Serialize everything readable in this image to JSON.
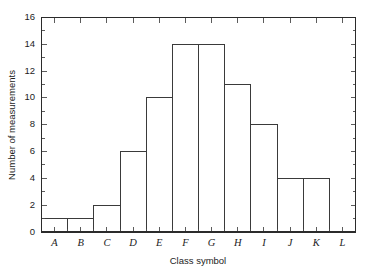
{
  "chart_data": {
    "type": "bar",
    "title": "",
    "subtitle": "",
    "xlabel": "Class symbol",
    "ylabel": "Number of measurements",
    "categories": [
      "A",
      "B",
      "C",
      "D",
      "E",
      "F",
      "G",
      "H",
      "I",
      "J",
      "K",
      "L"
    ],
    "values": [
      1,
      1,
      2,
      6,
      10,
      14,
      14,
      11,
      8,
      4,
      4,
      0
    ],
    "series": [
      {
        "name": "Number of measurements",
        "values": [
          1,
          1,
          2,
          6,
          10,
          14,
          14,
          11,
          8,
          4,
          4,
          0
        ]
      }
    ],
    "ylim": [
      0,
      16
    ],
    "xlim": [
      0,
      12
    ],
    "yticks": [
      0,
      2,
      4,
      6,
      8,
      10,
      12,
      14,
      16
    ],
    "ytick_labels": [
      "0",
      "2",
      "4",
      "6",
      "8",
      "10",
      "12",
      "14",
      "16"
    ],
    "ytick_minor_step": 1,
    "xtick_labels": [
      "A",
      "B",
      "C",
      "D",
      "E",
      "F",
      "G",
      "H",
      "I",
      "J",
      "K",
      "L"
    ],
    "grid": false,
    "legend": null,
    "legend_position": "none",
    "frame": "box",
    "tick_direction": "in",
    "bar_fill_color": "#ffffff",
    "bar_edge_color": "#3a3a3a",
    "axis_color": "#2b2b2b",
    "background_color": "#ffffff",
    "annotations": []
  },
  "figure": {
    "alt": "Histogram of number of measurements by class symbol A through L"
  }
}
